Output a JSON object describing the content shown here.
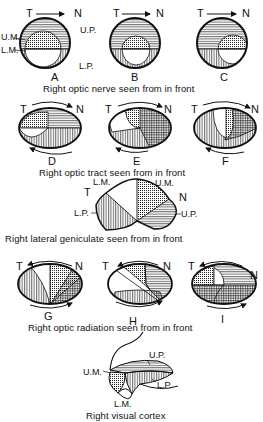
{
  "direction_labels": {
    "temporal": "T",
    "nasal": "N"
  },
  "quadrant_labels": {
    "upper_macular": "U.M.",
    "lower_macular": "L.M.",
    "upper_peripheral": "U.P.",
    "lower_peripheral": "L.P."
  },
  "legend_patterns": {
    "upper_macular": "dotted",
    "lower_macular": "blank",
    "upper_peripheral": "horizontal-lines",
    "lower_peripheral": "vertical-lines"
  },
  "sections": [
    {
      "caption": "Right optic nerve seen from in front",
      "panels": [
        {
          "letter": "A"
        },
        {
          "letter": "B"
        },
        {
          "letter": "C"
        }
      ]
    },
    {
      "caption": "Right optic tract seen from in front",
      "panels": [
        {
          "letter": "D"
        },
        {
          "letter": "E"
        },
        {
          "letter": "F"
        }
      ]
    },
    {
      "caption": "Right lateral geniculate seen from in front",
      "panels": []
    },
    {
      "caption": "Right optic radiation seen from in front",
      "panels": [
        {
          "letter": "G"
        },
        {
          "letter": "H"
        },
        {
          "letter": "I"
        }
      ]
    },
    {
      "caption": "Right visual cortex",
      "panels": []
    }
  ]
}
